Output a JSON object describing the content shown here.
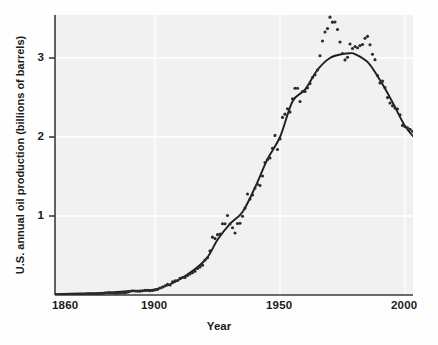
{
  "figure": {
    "background_color": "#fefefe",
    "plot_background_color": "#f0f0f0",
    "axis_color": "#3a3a3a",
    "grid_color": "#ffffff",
    "marker_color": "#2b2b2b",
    "curve_color": "#1f1f1f"
  },
  "chart_data": {
    "type": "scatter",
    "title": "",
    "subtitle": "",
    "xlabel": "Year",
    "ylabel": "U.S. annual oil production (billions of barrels)",
    "xlim": [
      1858,
      2010
    ],
    "ylim": [
      0,
      3.6
    ],
    "xticks": [
      1860,
      1900,
      1950,
      2000
    ],
    "xtick_labels": [
      "1860",
      "1900",
      "1950",
      "2000"
    ],
    "yticks": [
      1,
      2,
      3
    ],
    "ytick_labels": [
      "1",
      "2",
      "3"
    ],
    "grid": true,
    "grid_axes": "both",
    "legend": "none",
    "annotations": [],
    "series": [
      {
        "name": "U.S. annual oil production (data)",
        "type": "scatter",
        "marker": "circle",
        "color": "#2b2b2b",
        "x": [
          1860,
          1861,
          1862,
          1863,
          1864,
          1865,
          1866,
          1867,
          1868,
          1869,
          1870,
          1871,
          1872,
          1873,
          1874,
          1875,
          1876,
          1877,
          1878,
          1879,
          1880,
          1881,
          1882,
          1883,
          1884,
          1885,
          1886,
          1887,
          1888,
          1889,
          1890,
          1891,
          1892,
          1893,
          1894,
          1895,
          1896,
          1897,
          1898,
          1899,
          1900,
          1901,
          1902,
          1903,
          1904,
          1905,
          1906,
          1907,
          1908,
          1909,
          1910,
          1911,
          1912,
          1913,
          1914,
          1915,
          1916,
          1917,
          1918,
          1919,
          1920,
          1921,
          1922,
          1923,
          1924,
          1925,
          1926,
          1927,
          1928,
          1929,
          1930,
          1931,
          1932,
          1933,
          1934,
          1935,
          1936,
          1937,
          1938,
          1939,
          1940,
          1941,
          1942,
          1943,
          1944,
          1945,
          1946,
          1947,
          1948,
          1949,
          1950,
          1951,
          1952,
          1953,
          1954,
          1955,
          1956,
          1957,
          1958,
          1959,
          1960,
          1961,
          1962,
          1963,
          1964,
          1965,
          1966,
          1967,
          1968,
          1969,
          1970,
          1971,
          1972,
          1973,
          1974,
          1975,
          1976,
          1977,
          1978,
          1979,
          1980,
          1981,
          1982,
          1983,
          1984,
          1985,
          1986,
          1987,
          1988,
          1989,
          1990,
          1991,
          1992,
          1993,
          1994,
          1995,
          1996,
          1997,
          1998,
          1999,
          2000,
          2001,
          2002,
          2003,
          2004,
          2005,
          2006,
          2007
        ],
        "y": [
          0.0005,
          0.002,
          0.003,
          0.003,
          0.002,
          0.002,
          0.004,
          0.003,
          0.004,
          0.004,
          0.005,
          0.005,
          0.006,
          0.01,
          0.011,
          0.012,
          0.009,
          0.013,
          0.015,
          0.02,
          0.026,
          0.027,
          0.03,
          0.024,
          0.024,
          0.022,
          0.028,
          0.028,
          0.027,
          0.035,
          0.046,
          0.054,
          0.051,
          0.049,
          0.049,
          0.053,
          0.061,
          0.061,
          0.055,
          0.057,
          0.064,
          0.069,
          0.089,
          0.1,
          0.117,
          0.135,
          0.126,
          0.166,
          0.179,
          0.183,
          0.21,
          0.221,
          0.222,
          0.248,
          0.266,
          0.281,
          0.301,
          0.335,
          0.356,
          0.378,
          0.443,
          0.472,
          0.558,
          0.732,
          0.714,
          0.764,
          0.771,
          0.901,
          0.901,
          1.007,
          0.898,
          0.851,
          0.785,
          0.906,
          0.908,
          0.997,
          1.1,
          1.279,
          1.214,
          1.265,
          1.353,
          1.402,
          1.386,
          1.506,
          1.678,
          1.714,
          1.734,
          1.857,
          2.02,
          1.842,
          1.974,
          2.248,
          2.289,
          2.357,
          2.315,
          2.484,
          2.617,
          2.617,
          2.449,
          2.575,
          2.575,
          2.622,
          2.676,
          2.753,
          2.787,
          2.849,
          3.028,
          3.216,
          3.329,
          3.372,
          3.517,
          3.454,
          3.455,
          3.361,
          3.203,
          3.057,
          2.976,
          3.009,
          3.178,
          3.121,
          3.146,
          3.129,
          3.157,
          3.171,
          3.25,
          3.274,
          3.168,
          3.047,
          2.979,
          2.779,
          2.685,
          2.707,
          2.625,
          2.499,
          2.431,
          2.394,
          2.366,
          2.355,
          2.282,
          2.147,
          2.131,
          2.118,
          2.097,
          2.073,
          1.983,
          1.89,
          1.862,
          1.848
        ]
      },
      {
        "name": "Fitted curve",
        "type": "line",
        "color": "#1f1f1f",
        "x": [
          1860,
          1870,
          1880,
          1890,
          1900,
          1910,
          1920,
          1925,
          1930,
          1935,
          1940,
          1945,
          1950,
          1955,
          1960,
          1965,
          1970,
          1975,
          1978,
          1980,
          1985,
          1990,
          1995,
          2000,
          2005,
          2007
        ],
        "y": [
          0.01,
          0.02,
          0.03,
          0.05,
          0.07,
          0.2,
          0.44,
          0.7,
          0.9,
          1.05,
          1.36,
          1.72,
          2.0,
          2.45,
          2.6,
          2.85,
          3.0,
          3.05,
          3.06,
          3.05,
          2.95,
          2.72,
          2.44,
          2.14,
          1.95,
          1.9
        ]
      }
    ]
  },
  "axes": {
    "x_axis_name": "year-axis",
    "y_axis_name": "production-axis"
  }
}
